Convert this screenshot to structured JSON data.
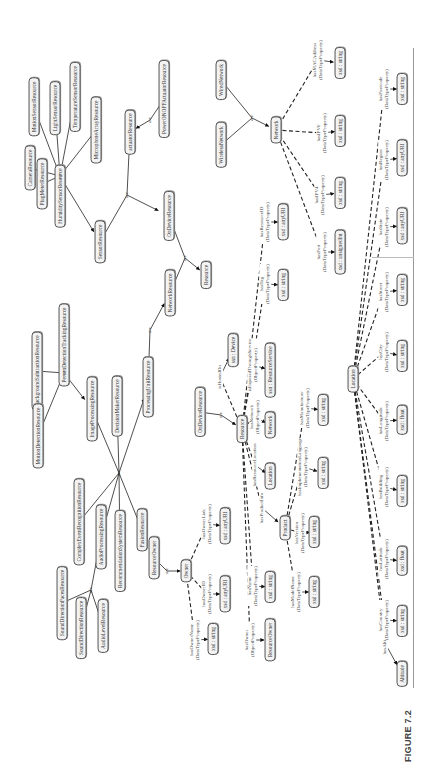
{
  "figure": {
    "caption": "FIGURE 7.2"
  },
  "diagram": {
    "isa_label": "are",
    "classes": [
      {
        "id": "motion_sensor",
        "label": "MotionSensorResource",
        "u": 663,
        "v": 34
      },
      {
        "id": "light_sensor",
        "label": "LightSensorResource",
        "u": 662,
        "v": 55
      },
      {
        "id": "temperature_sensor",
        "label": "TemperatureSensorResource",
        "u": 673,
        "v": 75
      },
      {
        "id": "microphone_array",
        "label": "MicrophoneArrayResource",
        "u": 640,
        "v": 96
      },
      {
        "id": "camera",
        "label": "CameraResource",
        "u": 602,
        "v": 30
      },
      {
        "id": "plug_meter",
        "label": "PlugMeterResource",
        "u": 586,
        "v": 42
      },
      {
        "id": "humidity_sensor",
        "label": "HumiditySensorResource",
        "u": 574,
        "v": 60
      },
      {
        "id": "sensor",
        "label": "SensorResource",
        "u": 528,
        "v": 100
      },
      {
        "id": "actuator",
        "label": "actuatorResource",
        "u": 638,
        "v": 130
      },
      {
        "id": "power_onoff_actuator",
        "label": "PowerONOFFActuatorResource",
        "u": 671,
        "v": 164
      },
      {
        "id": "ondevice_top",
        "label": "OnDeviceResource",
        "u": 554,
        "v": 169
      },
      {
        "id": "resource_top",
        "label": "Resource",
        "u": 495,
        "v": 206
      },
      {
        "id": "network_resource",
        "label": "NetworkResource",
        "u": 477,
        "v": 170
      },
      {
        "id": "processing_unit",
        "label": "ProcessingUnitResource",
        "u": 383,
        "v": 148
      },
      {
        "id": "background_subtraction",
        "label": "BackgroundSubtractionResource",
        "u": 399,
        "v": 37
      },
      {
        "id": "person_detection_tracking",
        "label": "PersonDetectionTrackingResource",
        "u": 425,
        "v": 64
      },
      {
        "id": "motion_detection",
        "label": "MotionDetectionResource",
        "u": 334,
        "v": 38
      },
      {
        "id": "image_processing",
        "label": "ImageProcessingResource",
        "u": 361,
        "v": 92
      },
      {
        "id": "decision_maker",
        "label": "DecisionMakerResource",
        "u": 364,
        "v": 117
      },
      {
        "id": "complex_event_recognition",
        "label": "ComplexEventRecognitionResource",
        "u": 248,
        "v": 79
      },
      {
        "id": "audio_processing",
        "label": "AudioProcessingResource",
        "u": 233,
        "v": 101
      },
      {
        "id": "recommendation_system",
        "label": "RecommendationSystemResource",
        "u": 219,
        "v": 120
      },
      {
        "id": "fusion",
        "label": "FusionResource",
        "u": 240,
        "v": 142
      },
      {
        "id": "sound_direction_faces",
        "label": "SoundDirectionFacesResource",
        "u": 167,
        "v": 62
      },
      {
        "id": "sound_direction",
        "label": "SoundDirectionResource",
        "u": 142,
        "v": 81
      },
      {
        "id": "audio_level",
        "label": "AudioLevelResource",
        "u": 144,
        "v": 103
      },
      {
        "id": "resource_owner_top",
        "label": "ResourceOwner",
        "u": 212,
        "v": 154
      },
      {
        "id": "owner",
        "label": "Owner",
        "u": 199,
        "v": 186
      },
      {
        "id": "ondevice_mid",
        "label": "OnDeviceResource",
        "u": 358,
        "v": 200
      },
      {
        "id": "device",
        "label": "ssn : Device",
        "u": 420,
        "v": 233
      },
      {
        "id": "resource_mid",
        "label": "Resource",
        "u": 341,
        "v": 242
      },
      {
        "id": "location_obj",
        "label": "Location",
        "u": 294,
        "v": 270
      },
      {
        "id": "network_obj",
        "label": "Network",
        "u": 345,
        "v": 270
      },
      {
        "id": "resource_service",
        "label": "ssn : ResourceService",
        "u": 400,
        "v": 270
      },
      {
        "id": "product",
        "label": "Product",
        "u": 242,
        "v": 285
      },
      {
        "id": "resource_owner_bottom",
        "label": "ResourceOwner",
        "u": 130,
        "v": 270
      },
      {
        "id": "location_main",
        "label": "Location",
        "u": 391,
        "v": 353
      },
      {
        "id": "altitude",
        "label": "Altitude",
        "u": 96,
        "v": 402
      },
      {
        "id": "wireless_network",
        "label": "WirelessNetwork",
        "u": 625,
        "v": 221
      },
      {
        "id": "wired_network",
        "label": "WiredNetwork",
        "u": 690,
        "v": 221
      },
      {
        "id": "network_main",
        "label": "Network",
        "u": 640,
        "v": 276
      }
    ],
    "datatypes": [
      {
        "id": "dt_owner_name",
        "label": "xsd : string",
        "u": 131,
        "v": 213
      },
      {
        "id": "dt_owner_id",
        "label": "xsd : anyURI",
        "u": 176,
        "v": 225
      },
      {
        "id": "dt_owner_link",
        "label": "xsd : anyURI",
        "u": 244,
        "v": 225
      },
      {
        "id": "dt_name",
        "label": "xsd : string",
        "u": 183,
        "v": 270
      },
      {
        "id": "dt_model_name",
        "label": "xsd : string",
        "u": 178,
        "v": 314
      },
      {
        "id": "dt_version",
        "label": "xsd : string",
        "u": 238,
        "v": 314
      },
      {
        "id": "dt_impl_language",
        "label": "xsd : string",
        "u": 297,
        "v": 323
      },
      {
        "id": "dt_manufacturer",
        "label": "xsd : string",
        "u": 360,
        "v": 323
      },
      {
        "id": "dt_tag",
        "label": "xsd : string",
        "u": 485,
        "v": 283
      },
      {
        "id": "dt_resource_id",
        "label": "xsd : anyURI",
        "u": 548,
        "v": 283
      },
      {
        "id": "dt_port",
        "label": "xsd : unsignedInt",
        "u": 518,
        "v": 340
      },
      {
        "id": "dt_ipv4",
        "label": "xsd : string",
        "u": 577,
        "v": 340
      },
      {
        "id": "dt_ipv6",
        "label": "xsd : string",
        "u": 639,
        "v": 340
      },
      {
        "id": "dt_mac",
        "label": "xsd : string",
        "u": 707,
        "v": 340
      },
      {
        "id": "dt_country",
        "label": "xsd : string",
        "u": 149,
        "v": 402
      },
      {
        "id": "dt_latitude",
        "label": "xsd : float",
        "u": 209,
        "v": 402
      },
      {
        "id": "dt_building",
        "label": "xsd : string",
        "u": 279,
        "v": 402
      },
      {
        "id": "dt_longitude",
        "label": "xsd : float",
        "u": 350,
        "v": 402
      },
      {
        "id": "dt_city",
        "label": "xsd : string",
        "u": 414,
        "v": 402
      },
      {
        "id": "dt_street",
        "label": "xsd : string",
        "u": 480,
        "v": 402
      },
      {
        "id": "dt_state",
        "label": "xsd : anyURI",
        "u": 544,
        "v": 402
      },
      {
        "id": "dt_region",
        "label": "xsd : anyURI",
        "u": 612,
        "v": 402
      },
      {
        "id": "dt_postcode",
        "label": "xsd : string",
        "u": 681,
        "v": 402
      }
    ],
    "property_labels": [
      {
        "id": "p_owner_name",
        "text": "hasOwnerName\n(DataTypeProperty)",
        "u": 130,
        "v": 195
      },
      {
        "id": "p_owner_id",
        "text": "hasOwnerID\n(DataTypeProperty)",
        "u": 176,
        "v": 207
      },
      {
        "id": "p_owner_link",
        "text": "hasOwnerLink\n(DataTypeProperty)",
        "u": 246,
        "v": 207
      },
      {
        "id": "p_owner",
        "text": "hasOwner\n(ObjectProperty)",
        "u": 130,
        "v": 250
      },
      {
        "id": "p_name",
        "text": "hasName\n(DataTypeProperty)",
        "u": 184,
        "v": 253
      },
      {
        "id": "p_model_name",
        "text": "hasModelName\n(DataTypeProperty)",
        "u": 178,
        "v": 296
      },
      {
        "id": "p_version",
        "text": "hasVersion\n(DataTypeProperty)",
        "u": 237,
        "v": 300
      },
      {
        "id": "p_product_info",
        "text": "hasProductInfo",
        "u": 262,
        "v": 262
      },
      {
        "id": "p_resource_location",
        "text": "hasResourceLocation",
        "u": 305,
        "v": 255
      },
      {
        "id": "p_impl_language",
        "text": "hasImplementationLanguage\n(DataTypeProperty)",
        "u": 303,
        "v": 303
      },
      {
        "id": "p_manufacturer",
        "text": "hasManufacturer\n(DataTypeProperty)",
        "u": 362,
        "v": 305
      },
      {
        "id": "p_network",
        "text": "hasNetwork\n(ObjectProperty)",
        "u": 353,
        "v": 255
      },
      {
        "id": "p_exposed_service",
        "text": "isExposedThroughService\n(ObjectProperty)",
        "u": 405,
        "v": 253
      },
      {
        "id": "p_hosted_on",
        "text": "isHostedOn",
        "u": 393,
        "v": 220
      },
      {
        "id": "p_tag",
        "text": "hasTag\n(DataTypeProperty)",
        "u": 486,
        "v": 265
      },
      {
        "id": "p_resource_id",
        "text": "hasResourceID\n(DataTypeProperty)",
        "u": 548,
        "v": 265
      },
      {
        "id": "p_port",
        "text": "hasPort\n(DataTypeProperty)",
        "u": 518,
        "v": 322
      },
      {
        "id": "p_ipv4",
        "text": "hasIPV4\n(DataTypeProperty)",
        "u": 575,
        "v": 320
      },
      {
        "id": "p_ipv6",
        "text": "hasIPV6\n(DataTypeProperty)",
        "u": 637,
        "v": 322
      },
      {
        "id": "p_mac",
        "text": "hasMACAddress\n(DataTypeProperty)",
        "u": 710,
        "v": 318
      },
      {
        "id": "p_altitude",
        "text": "hasAltitude",
        "u": 127,
        "v": 385
      },
      {
        "id": "p_country",
        "text": "hasCountry\n(DataTypeProperty)",
        "u": 150,
        "v": 384
      },
      {
        "id": "p_latitude",
        "text": "hasLatitude\n(DataTypeProperty)",
        "u": 211,
        "v": 384
      },
      {
        "id": "p_building",
        "text": "hasBuilding\n(DataTypeProperty)",
        "u": 283,
        "v": 384
      },
      {
        "id": "p_longitude",
        "text": "hasLongitude\n(DataTypeProperty)",
        "u": 349,
        "v": 384
      },
      {
        "id": "p_city",
        "text": "hasCity\n(DataTypeProperty)",
        "u": 418,
        "v": 384
      },
      {
        "id": "p_street",
        "text": "hasStreet\n(DataTypeProperty)",
        "u": 478,
        "v": 384
      },
      {
        "id": "p_state",
        "text": "hasState\n(DataTypeProperty)",
        "u": 543,
        "v": 384
      },
      {
        "id": "p_region",
        "text": "hasRegion\n(DataTypeProperty)",
        "u": 610,
        "v": 384
      },
      {
        "id": "p_postcode",
        "text": "hasPostcode\n(DataTypeProperty)",
        "u": 681,
        "v": 384
      }
    ],
    "isa_junctions": [
      {
        "id": "j_sensor",
        "u": 594,
        "v": 60
      },
      {
        "id": "j_actuator",
        "u": 650,
        "v": 150
      },
      {
        "id": "j_ondevice",
        "u": 575,
        "v": 127
      },
      {
        "id": "j_resource_top",
        "u": 512,
        "v": 185
      },
      {
        "id": "j_network_res",
        "u": 440,
        "v": 150
      },
      {
        "id": "j_image",
        "u": 397,
        "v": 64
      },
      {
        "id": "j_processing",
        "u": 297,
        "v": 119
      },
      {
        "id": "j_audio",
        "u": 180,
        "v": 91
      },
      {
        "id": "j_owner",
        "u": 199,
        "v": 167
      },
      {
        "id": "j_resource_mid",
        "u": 355,
        "v": 221
      },
      {
        "id": "j_network",
        "u": 652,
        "v": 252
      }
    ]
  }
}
